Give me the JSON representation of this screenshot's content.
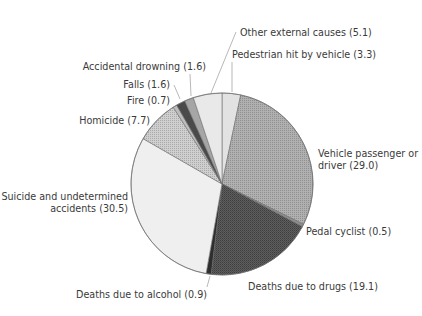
{
  "chart_data": {
    "type": "pie",
    "title": "",
    "start_angle_deg": 0,
    "direction": "clockwise",
    "center": [
      222,
      184
    ],
    "radius": 91,
    "slices": [
      {
        "label": "Pedestrian hit by vehicle",
        "value": 3.3,
        "color": "#e2e2e2",
        "pattern": "none"
      },
      {
        "label": "Vehicle passenger or driver",
        "value": 29.0,
        "color": "#b0b0b0",
        "pattern": "dots"
      },
      {
        "label": "Pedal cyclist",
        "value": 0.5,
        "color": "#8c8c8c",
        "pattern": "none"
      },
      {
        "label": "Deaths due to drugs",
        "value": 19.1,
        "color": "#5e5e5e",
        "pattern": "crosshatch"
      },
      {
        "label": "Deaths due to alcohol",
        "value": 0.9,
        "color": "#2e2e2e",
        "pattern": "none"
      },
      {
        "label": "Suicide and undetermined accidents",
        "value": 30.5,
        "color": "#efefef",
        "pattern": "none"
      },
      {
        "label": "Homicide",
        "value": 7.7,
        "color": "#cfcfcf",
        "pattern": "dots"
      },
      {
        "label": "Fire",
        "value": 0.7,
        "color": "#bdbdbd",
        "pattern": "none"
      },
      {
        "label": "Falls",
        "value": 1.6,
        "color": "#4a4a4a",
        "pattern": "none"
      },
      {
        "label": "Accidental drowning",
        "value": 1.6,
        "color": "#a6a6a6",
        "pattern": "none"
      },
      {
        "label": "Other external causes",
        "value": 5.1,
        "color": "#e9e9e9",
        "pattern": "none"
      }
    ],
    "labels": [
      {
        "text": "Pedestrian hit by vehicle (3.3)",
        "x": 232,
        "y": 58,
        "anchor": "start",
        "leader": [
          [
            232,
            62
          ],
          [
            232,
            92
          ]
        ]
      },
      {
        "text": "Vehicle passenger or",
        "x": 318,
        "y": 157,
        "anchor": "start",
        "leader": null
      },
      {
        "text": "driver (29.0)",
        "x": 318,
        "y": 169,
        "anchor": "start",
        "leader": null
      },
      {
        "text": "Pedal cyclist (0.5)",
        "x": 306,
        "y": 235,
        "anchor": "start",
        "leader": null
      },
      {
        "text": "Deaths due to drugs (19.1)",
        "x": 248,
        "y": 290,
        "anchor": "start",
        "leader": null
      },
      {
        "text": "Deaths due to alcohol (0.9)",
        "x": 207,
        "y": 298,
        "anchor": "end",
        "leader": [
          [
            207,
            287
          ],
          [
            210,
            276
          ]
        ]
      },
      {
        "text": "Suicide and undetermined",
        "x": 128,
        "y": 200,
        "anchor": "end",
        "leader": null
      },
      {
        "text": "accidents (30.5)",
        "x": 128,
        "y": 212,
        "anchor": "end",
        "leader": null
      },
      {
        "text": "Homicide (7.7)",
        "x": 150,
        "y": 124,
        "anchor": "end",
        "leader": null
      },
      {
        "text": "Fire (0.7)",
        "x": 170,
        "y": 104,
        "anchor": "end",
        "leader": null
      },
      {
        "text": "Falls (1.6)",
        "x": 170,
        "y": 88,
        "anchor": "end",
        "leader": [
          [
            174,
            85
          ],
          [
            180,
            99
          ]
        ]
      },
      {
        "text": "Accidental drowning (1.6)",
        "x": 206,
        "y": 70,
        "anchor": "end",
        "leader": [
          [
            190,
            74
          ],
          [
            191,
            96
          ]
        ]
      },
      {
        "text": "Other external causes (5.1)",
        "x": 240,
        "y": 36,
        "anchor": "start",
        "leader": [
          [
            236,
            32
          ],
          [
            211,
            93
          ]
        ]
      }
    ]
  }
}
